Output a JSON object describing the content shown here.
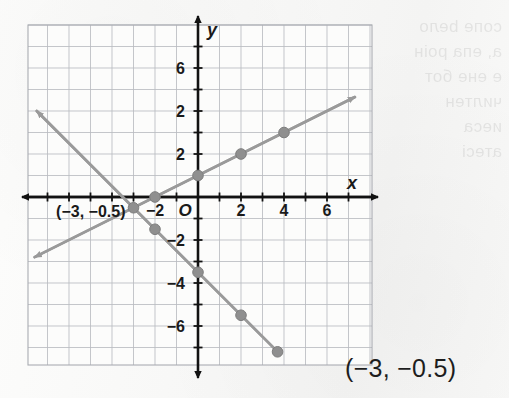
{
  "answer": {
    "text": "(−3, −0.5)"
  },
  "bleed_through": {
    "lines": "сопе bело\nа, епа роін\nе ене бот\nчилтен\nиеса\nатесі"
  },
  "chart_data": {
    "type": "line",
    "title": "",
    "xlabel": "x",
    "ylabel": "y",
    "xlim": [
      -8,
      8
    ],
    "ylim": [
      -8,
      8
    ],
    "grid": true,
    "legend": "none",
    "axis_origin_label": "O",
    "xticks": [
      -2,
      2,
      4,
      6
    ],
    "xtick_labels": [
      "−2",
      "2",
      "4",
      "6"
    ],
    "yticks": [
      6,
      4,
      2,
      -2,
      -4,
      -6
    ],
    "ytick_labels": [
      "6",
      "2",
      "2",
      "−2",
      "−4",
      "−6"
    ],
    "annotations": [
      {
        "text": "(−3, −0.5)",
        "x": -6.6,
        "y": -0.95
      }
    ],
    "series": [
      {
        "name": "rising-line",
        "equation": "y = 0.5x + 1",
        "slope": 0.5,
        "intercept": 1,
        "color": "#9a9a9a",
        "x_start": -7.6,
        "x_end": 7.3,
        "arrow_start": true,
        "arrow_end": true,
        "points": [
          {
            "x": -2,
            "y": 0
          },
          {
            "x": 0,
            "y": 1
          },
          {
            "x": 2,
            "y": 2
          },
          {
            "x": 4,
            "y": 3
          }
        ]
      },
      {
        "name": "falling-line",
        "equation": "y = −x − 3.5",
        "slope": -1,
        "intercept": -3.5,
        "color": "#9a9a9a",
        "x_start": -7.5,
        "x_end": 3.8,
        "arrow_start": true,
        "arrow_end": true,
        "points": [
          {
            "x": -3,
            "y": -0.5
          },
          {
            "x": -2,
            "y": -1.5
          },
          {
            "x": 0,
            "y": -3.5
          },
          {
            "x": 2,
            "y": -5.5
          },
          {
            "x": 3.7,
            "y": -7.2
          }
        ]
      }
    ],
    "intersection": {
      "x": -3,
      "y": -0.5
    }
  }
}
